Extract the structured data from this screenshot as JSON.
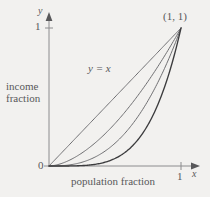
{
  "figure": {
    "background_color": "#f2f1ef",
    "axis_color": "#8c8c8e",
    "text_color": "#58585a"
  },
  "labels": {
    "y_axis": "y",
    "x_axis": "x",
    "y_tick_one": "1",
    "x_tick_one": "1",
    "origin": "0",
    "corner_point": "(1, 1)",
    "diagonal_equation": "y = x",
    "income_line1": "income",
    "income_line2": "fraction",
    "population": "population fraction"
  },
  "chart_data": {
    "type": "line",
    "title": "",
    "xlabel": "population fraction",
    "ylabel": "income fraction",
    "xlim": [
      0,
      1
    ],
    "ylim": [
      0,
      1
    ],
    "xticks": [
      0,
      1
    ],
    "xticklabels": [
      "0",
      "1"
    ],
    "yticks": [
      0,
      1
    ],
    "yticklabels": [
      "0",
      "1"
    ],
    "grid": false,
    "legend": false,
    "annotations": [
      {
        "text": "(1, 1)",
        "x": 1.0,
        "y": 1.0
      },
      {
        "text": "y = x",
        "x": 0.38,
        "y": 0.72
      }
    ],
    "series": [
      {
        "name": "y = x",
        "exponent": 1.0,
        "color": "#6f6f72",
        "width": 1.0,
        "x": [
          0,
          0.1,
          0.2,
          0.3,
          0.4,
          0.5,
          0.6,
          0.7,
          0.8,
          0.9,
          1.0
        ],
        "values": [
          0,
          0.1,
          0.2,
          0.3,
          0.4,
          0.5,
          0.6,
          0.7,
          0.8,
          0.9,
          1.0
        ]
      },
      {
        "name": "Lorenz curve 1",
        "exponent": 1.7,
        "color": "#6f6f72",
        "width": 1.0,
        "x": [
          0,
          0.1,
          0.2,
          0.3,
          0.4,
          0.5,
          0.6,
          0.7,
          0.8,
          0.9,
          1.0
        ],
        "values": [
          0,
          0.02,
          0.066,
          0.131,
          0.212,
          0.308,
          0.417,
          0.539,
          0.674,
          0.821,
          1.0
        ]
      },
      {
        "name": "Lorenz curve 2",
        "exponent": 2.6,
        "color": "#6f6f72",
        "width": 1.0,
        "x": [
          0,
          0.1,
          0.2,
          0.3,
          0.4,
          0.5,
          0.6,
          0.7,
          0.8,
          0.9,
          1.0
        ],
        "values": [
          0,
          0.0025,
          0.0153,
          0.0431,
          0.0893,
          0.1649,
          0.2665,
          0.3968,
          0.5578,
          0.7513,
          1.0
        ]
      },
      {
        "name": "Lorenz curve 3",
        "exponent": 4.2,
        "color": "#3c3c3e",
        "width": 1.35,
        "x": [
          0,
          0.1,
          0.2,
          0.3,
          0.4,
          0.5,
          0.6,
          0.7,
          0.8,
          0.9,
          1.0
        ],
        "values": [
          0,
          6e-05,
          0.0011,
          0.0058,
          0.0193,
          0.0544,
          0.1176,
          0.2247,
          0.3903,
          0.636,
          1.0
        ]
      }
    ]
  }
}
